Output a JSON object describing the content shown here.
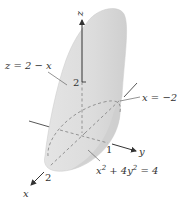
{
  "figure": {
    "type": "3d-solid-diagram",
    "axes": {
      "z": {
        "label": "z",
        "tick": "2"
      },
      "y": {
        "label": "y",
        "tick": "1"
      },
      "x": {
        "label": "x",
        "tick": "2"
      }
    },
    "annotations": {
      "plane": "z = 2 − x",
      "plane_x": "x = −2",
      "cylinder_base": "x",
      "cylinder_sup": "2",
      "cylinder_rest": " + 4y",
      "cylinder_sup2": "2",
      "cylinder_end": " = 4"
    },
    "colors": {
      "surface": "#d9d9d9",
      "surface_light": "#e8e8e8",
      "axis": "#333333",
      "dashed": "#8a8a8a"
    }
  }
}
